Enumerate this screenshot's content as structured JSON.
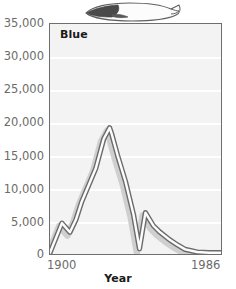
{
  "figure": {
    "illustration": "blue-whale-silhouette",
    "series_label": "Blue"
  },
  "chart_data": {
    "type": "line",
    "title": "Blue",
    "xlabel": "Year",
    "ylabel": "",
    "xlim": [
      1900,
      1986
    ],
    "ylim": [
      0,
      35000
    ],
    "grid": true,
    "legend": null,
    "style": "double-stroke band with drop shadow",
    "y_ticks": [
      0,
      5000,
      10000,
      15000,
      20000,
      25000,
      30000,
      35000
    ],
    "y_tick_labels": [
      "0",
      "5,000",
      "10,000",
      "15,000",
      "20,000",
      "25,000",
      "30,000",
      "35,000"
    ],
    "x_ticks": [
      1900,
      1986
    ],
    "x_tick_labels": [
      "1900",
      "1986"
    ],
    "series": [
      {
        "name": "Blue",
        "x": [
          1900,
          1906,
          1910,
          1913,
          1916,
          1923,
          1927,
          1930,
          1931,
          1934,
          1938,
          1942,
          1945,
          1948,
          1952,
          1955,
          1960,
          1964,
          1968,
          1974,
          1980,
          1986
        ],
        "values": [
          200,
          4700,
          3300,
          5200,
          8000,
          13000,
          17500,
          19200,
          18300,
          15000,
          11000,
          6000,
          800,
          6300,
          4300,
          3400,
          2200,
          1400,
          700,
          300,
          200,
          200
        ]
      }
    ],
    "colors": {
      "line": "#6b6b6b",
      "line_fill": "#ffffff",
      "shadow": "#cccccc",
      "plot_background": "#f3f3f3",
      "gridline": "#ffffff",
      "frame": "#6e6e6e",
      "tick_text": "#6b6b6b",
      "title_text": "#1a1a1a"
    }
  }
}
